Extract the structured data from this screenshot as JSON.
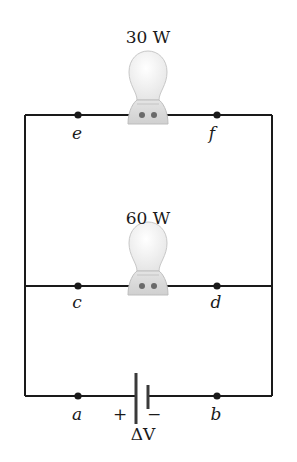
{
  "colors": {
    "wire": "#1a1a1a",
    "bulb_glass": "#f4f4f4",
    "bulb_outline": "#c8c8c8",
    "bulb_base": "#dcdcdc"
  },
  "bulbs": [
    {
      "label": "30 W",
      "branch": "top"
    },
    {
      "label": "60 W",
      "branch": "middle"
    }
  ],
  "nodes": {
    "e": "e",
    "f": "f",
    "c": "c",
    "d": "d",
    "a": "a",
    "b": "b"
  },
  "battery": {
    "plus": "+",
    "minus": "−",
    "label": "ΔV"
  }
}
